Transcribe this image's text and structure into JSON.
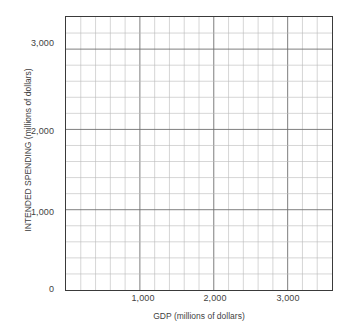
{
  "chart_data": {
    "type": "scatter",
    "title": "",
    "subtitle": "",
    "xlabel": "GDP (millions of dollars)",
    "ylabel": "INTENDED SPENDING (millions of dollars)",
    "xlim": [
      0,
      3600
    ],
    "ylim": [
      0,
      3400
    ],
    "x_major_ticks": [
      1000,
      2000,
      3000
    ],
    "x_major_tick_labels": [
      "1,000",
      "2,000",
      "3,000"
    ],
    "y_major_ticks": [
      0,
      1000,
      2000,
      3000
    ],
    "y_major_tick_labels": [
      "0",
      "1,000",
      "2,000",
      "3,000"
    ],
    "x_minor_step": 200,
    "y_minor_step": 200,
    "x_minor_gridline_count": 18,
    "y_minor_gridline_count": 17,
    "grid": true,
    "grid_minor": true,
    "legend": null,
    "legend_position": "none",
    "series": [
      {
        "name": "intended spending vs GDP",
        "x": [],
        "y": []
      }
    ],
    "annotations": [],
    "colors": {
      "frame": "#3a3a3a",
      "major_grid": "#6e6e6e",
      "minor_grid": "#b9b9b9",
      "plot_background": "#ffffff",
      "text": "#3f3f3f"
    }
  },
  "axes": {
    "x": {
      "label": "GDP (millions of dollars)",
      "ticks": [
        {
          "value": 1000,
          "label": "1,000"
        },
        {
          "value": 2000,
          "label": "2,000"
        },
        {
          "value": 3000,
          "label": "3,000"
        }
      ]
    },
    "y": {
      "label": "INTENDED SPENDING (millions of dollars)",
      "ticks": [
        {
          "value": 0,
          "label": "0"
        },
        {
          "value": 1000,
          "label": "1,000"
        },
        {
          "value": 2000,
          "label": "2,000"
        },
        {
          "value": 3000,
          "label": "3,000"
        }
      ]
    }
  }
}
